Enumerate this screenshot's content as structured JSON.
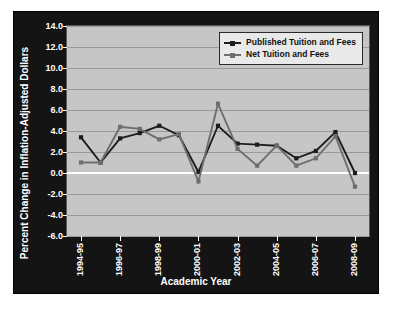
{
  "chart_data": {
    "type": "line",
    "title": "",
    "xlabel": "Academic Year",
    "ylabel": "Percent Change in Inflation-Adjusted Dollars",
    "ylim": [
      -6.0,
      14.0
    ],
    "ytick_labels": [
      "14.0",
      "12.0",
      "10.0",
      "8.0",
      "6.0",
      "4.0",
      "2.0",
      "0.0",
      "-2.0",
      "-4.0",
      "-6.0"
    ],
    "ytick_values": [
      14.0,
      12.0,
      10.0,
      8.0,
      6.0,
      4.0,
      2.0,
      0.0,
      -2.0,
      -4.0,
      -6.0
    ],
    "grid": true,
    "legend_position": "top-right",
    "categories": [
      "1994-95",
      "1995-96",
      "1996-97",
      "1997-98",
      "1998-99",
      "1999-00",
      "2000-01",
      "2001-02",
      "2002-03",
      "2003-04",
      "2004-05",
      "2005-06",
      "2006-07",
      "2007-08",
      "2008-09"
    ],
    "xtick_labels": [
      "1994-95",
      "",
      "1996-97",
      "",
      "1998-99",
      "",
      "2000-01",
      "",
      "2002-03",
      "",
      "2004-05",
      "",
      "2006-07",
      "",
      "2008-09"
    ],
    "series": [
      {
        "name": "Published Tuition and Fees",
        "color": "#1d1d1d",
        "values": [
          3.4,
          1.0,
          3.3,
          3.8,
          4.5,
          3.6,
          0.1,
          4.5,
          2.8,
          2.7,
          2.6,
          1.4,
          2.1,
          3.9,
          0.0
        ]
      },
      {
        "name": "Net Tuition and Fees",
        "color": "#6e6e6e",
        "values": [
          1.0,
          1.0,
          4.4,
          4.2,
          3.2,
          3.7,
          -0.8,
          6.6,
          2.3,
          0.7,
          2.6,
          0.7,
          1.4,
          3.5,
          -1.3
        ]
      }
    ]
  },
  "legend": {
    "items": [
      {
        "label": "Published Tuition and Fees",
        "color": "#1d1d1d"
      },
      {
        "label": "Net Tuition and Fees",
        "color": "#6e6e6e"
      }
    ]
  },
  "axes": {
    "x_title": "Academic Year",
    "y_title": "Percent Change in Inflation-Adjusted Dollars"
  },
  "colors": {
    "frame": "#141414",
    "plot_background": "#c6c6c6",
    "gridline": "#9a9a9a",
    "zero_line": "#ffffff",
    "axis_text": "#ffffff",
    "published": "#1d1d1d",
    "net": "#6e6e6e"
  }
}
